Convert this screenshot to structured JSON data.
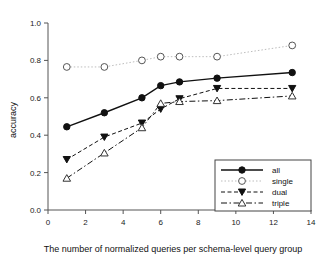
{
  "chart_data": {
    "type": "line",
    "title": "",
    "xlabel": "The number of normalized queries per schema-level query group",
    "ylabel": "accuracy",
    "xlim": [
      0,
      14
    ],
    "ylim": [
      0.0,
      1.0
    ],
    "xticks": [
      0,
      2,
      4,
      6,
      8,
      10,
      12,
      14
    ],
    "xtick_labels": [
      "0",
      "2",
      "4",
      "6",
      "8",
      "10",
      "12",
      "14"
    ],
    "yticks": [
      0.0,
      0.2,
      0.4,
      0.6,
      0.8,
      1.0
    ],
    "ytick_labels": [
      "0.0",
      "0.2",
      "0.4",
      "0.6",
      "0.8",
      "1.0"
    ],
    "grid": false,
    "legend_position": "lower-right",
    "series": [
      {
        "name": "all",
        "marker": "filled-circle",
        "line_style": "solid",
        "x": [
          1,
          3,
          5,
          6,
          7,
          9,
          13
        ],
        "values": [
          0.445,
          0.52,
          0.6,
          0.665,
          0.685,
          0.705,
          0.735
        ]
      },
      {
        "name": "single",
        "marker": "open-circle",
        "line_style": "dotted",
        "x": [
          1,
          3,
          5,
          6,
          7,
          9,
          13
        ],
        "values": [
          0.765,
          0.765,
          0.8,
          0.82,
          0.82,
          0.82,
          0.88
        ]
      },
      {
        "name": "dual",
        "marker": "filled-triangle-down",
        "line_style": "dashed",
        "x": [
          1,
          3,
          5,
          6,
          7,
          9,
          13
        ],
        "values": [
          0.27,
          0.39,
          0.465,
          0.54,
          0.595,
          0.65,
          0.65
        ]
      },
      {
        "name": "triple",
        "marker": "open-triangle-up",
        "line_style": "dash-dot",
        "x": [
          1,
          3,
          5,
          6,
          7,
          9,
          13
        ],
        "values": [
          0.17,
          0.305,
          0.44,
          0.57,
          0.58,
          0.585,
          0.61
        ]
      }
    ]
  },
  "legend": {
    "entries": [
      {
        "label": "all"
      },
      {
        "label": "single"
      },
      {
        "label": "dual"
      },
      {
        "label": "triple"
      }
    ]
  },
  "colors": {
    "axis": "#555555",
    "all": "#111111",
    "single": "#bdbdbd",
    "dual": "#111111",
    "triple": "#111111",
    "background": "#ffffff"
  }
}
